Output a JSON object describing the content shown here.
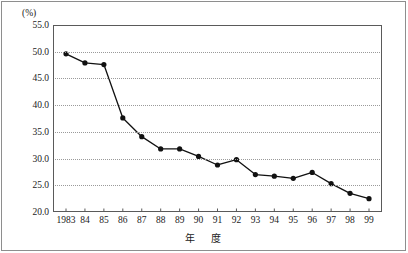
{
  "chart_data": {
    "type": "line",
    "title": "",
    "xlabel": "年　度",
    "ylabel": "",
    "unit_label": "(%)",
    "categories": [
      "1983",
      "84",
      "85",
      "86",
      "87",
      "88",
      "89",
      "90",
      "91",
      "92",
      "93",
      "94",
      "95",
      "96",
      "97",
      "98",
      "99"
    ],
    "values": [
      49.6,
      47.9,
      47.6,
      37.6,
      34.1,
      31.8,
      31.8,
      30.4,
      28.8,
      29.8,
      27.0,
      26.7,
      26.3,
      27.4,
      25.3,
      23.5,
      22.5
    ],
    "series": [
      {
        "name": "",
        "values": [
          49.6,
          47.9,
          47.6,
          37.6,
          34.1,
          31.8,
          31.8,
          30.4,
          28.8,
          29.8,
          27.0,
          26.7,
          26.3,
          27.4,
          25.3,
          23.5,
          22.5
        ]
      }
    ],
    "ylim": [
      20.0,
      55.0
    ],
    "ytick_values": [
      55.0,
      50.0,
      45.0,
      40.0,
      35.0,
      30.0,
      25.0,
      20.0
    ],
    "ytick_labels": [
      "55.0",
      "50.0",
      "45.0",
      "40.0",
      "35.0",
      "30.0",
      "25.0",
      "20.0"
    ],
    "grid": true,
    "grid_style": "dotted-horizontal",
    "legend": false,
    "legend_position": "none",
    "marker": "filled-circle",
    "line_color": "#111111",
    "grid_color": "#9a9a9a",
    "axis_color": "#5a5a5a",
    "frame_color": "#8e8e8e",
    "background": "#ffffff"
  }
}
